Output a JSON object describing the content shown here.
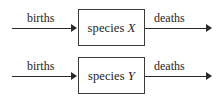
{
  "diagram": {
    "background_color": "#ffffff",
    "line_color": "#2b2b2b",
    "box_border_color": "#3a3a3a",
    "text_color": "#1d1d1d",
    "rows": [
      {
        "id": "species-x-row",
        "inflow_label": "births",
        "compartment_word": "species",
        "compartment_variable": "X",
        "outflow_label": "deaths",
        "inflow_arrow_icon": "arrow-right-icon",
        "outflow_arrow_icon": "arrow-right-icon"
      },
      {
        "id": "species-y-row",
        "inflow_label": "births",
        "compartment_word": "species",
        "compartment_variable": "Y",
        "outflow_label": "deaths",
        "inflow_arrow_icon": "arrow-right-icon",
        "outflow_arrow_icon": "arrow-right-icon"
      }
    ]
  }
}
